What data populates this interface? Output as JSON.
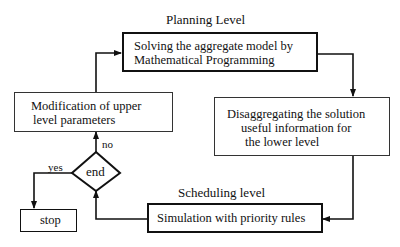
{
  "diagram": {
    "planning_label": "Planning Level",
    "scheduling_label": "Scheduling level",
    "nodes": {
      "solve": {
        "line1": "Solving the aggregate model by",
        "line2": "Mathematical Programming"
      },
      "disaggregate": {
        "line1": "Disaggregating the solution",
        "line2": "useful information for",
        "line3": "the lower level"
      },
      "simulation": {
        "line1": "Simulation with priority rules"
      },
      "modification": {
        "line1": "Modification of upper",
        "line2": "level parameters"
      },
      "decision": {
        "label": "end"
      },
      "stop": {
        "label": "stop"
      }
    },
    "edge_labels": {
      "yes": "yes",
      "no": "no"
    }
  }
}
